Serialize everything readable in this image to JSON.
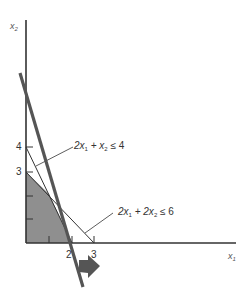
{
  "diagram": {
    "title": "",
    "axes": {
      "x_label": "x",
      "x_label_sub": "1",
      "y_label": "x",
      "y_label_sub": "2"
    },
    "x_ticks": [
      "2",
      "3"
    ],
    "y_ticks": [
      "4",
      "3"
    ],
    "constraints": [
      {
        "lhs_a": "2x",
        "sub_a": "1",
        "plus": " + x",
        "sub_b": "2",
        "rhs": " ≤ 4"
      },
      {
        "lhs_a": "2x",
        "sub_a": "1",
        "plus": " + 2x",
        "sub_b": "2",
        "rhs": " ≤ 6"
      }
    ],
    "feasible_region_color": "#8f8f8f",
    "objective_line_color": "#555555",
    "arrow_icon": "direction-arrow"
  }
}
